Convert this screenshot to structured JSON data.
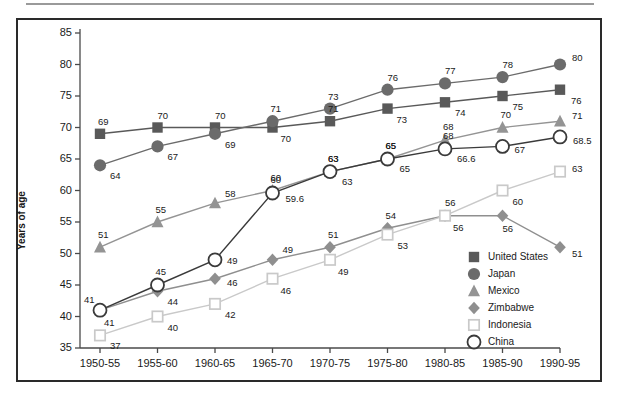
{
  "chart_data": {
    "type": "line",
    "title": "",
    "xlabel": "",
    "ylabel": "Years of age",
    "ylim": [
      35,
      85
    ],
    "yticks": [
      35,
      40,
      45,
      50,
      55,
      60,
      65,
      70,
      75,
      80,
      85
    ],
    "grid": false,
    "legend_position": "inside-lower-right",
    "categories": [
      "1950-55",
      "1955-60",
      "1960-65",
      "1965-70",
      "1970-75",
      "1975-80",
      "1980-85",
      "1985-90",
      "1990-95"
    ],
    "series": [
      {
        "name": "United States",
        "marker": "filled-square",
        "color": "#595959",
        "values": [
          69,
          70,
          70,
          70,
          71,
          73,
          74,
          75,
          76
        ],
        "labels": [
          "69",
          "70",
          "70",
          "70",
          "71",
          "73",
          "74",
          "75",
          "76"
        ]
      },
      {
        "name": "Japan",
        "marker": "filled-circle",
        "color": "#6b6b6b",
        "values": [
          64,
          67,
          69,
          71,
          73,
          76,
          77,
          78,
          80
        ],
        "labels": [
          "64",
          "67",
          "69",
          "71",
          "73",
          "76",
          "77",
          "78",
          "80"
        ]
      },
      {
        "name": "Mexico",
        "marker": "filled-triangle",
        "color": "#949494",
        "values": [
          51,
          55,
          58,
          60,
          63,
          65,
          68,
          70,
          71
        ],
        "labels": [
          "51",
          "55",
          "58",
          "60",
          "63",
          "65",
          "68",
          "70",
          "71"
        ]
      },
      {
        "name": "Zimbabwe",
        "marker": "filled-diamond",
        "color": "#8f8f8f",
        "values": [
          41,
          44,
          46,
          49,
          51,
          54,
          56,
          56,
          51
        ],
        "labels": [
          "41",
          "44",
          "46",
          "49",
          "51",
          "54",
          "56",
          "56",
          "51"
        ]
      },
      {
        "name": "Indonesia",
        "marker": "open-square",
        "color": "#c9c9c9",
        "values": [
          37,
          40,
          42,
          46,
          49,
          53,
          56,
          60,
          63
        ],
        "labels": [
          "37",
          "40",
          "42",
          "46",
          "49",
          "53",
          "56",
          "60",
          "63"
        ]
      },
      {
        "name": "China",
        "marker": "open-circle",
        "color": "#3a3a3a",
        "values": [
          41,
          45,
          49,
          59.6,
          63,
          65,
          66.6,
          67,
          68.5
        ],
        "labels": [
          "41",
          "45",
          "49",
          "60",
          "63",
          "65",
          "68",
          "67",
          "68.5"
        ],
        "value_labels": [
          "41",
          "45",
          "49",
          "59.6",
          "63",
          "65",
          "66.6",
          "67",
          "68.5"
        ]
      }
    ],
    "colors": {
      "axis": "#4a4a4a",
      "frame": "#2a2a2a",
      "text": "#1a1a1a",
      "background": "#ffffff"
    }
  },
  "legend": {
    "items": [
      {
        "label": "United States",
        "marker": "filled-square"
      },
      {
        "label": "Japan",
        "marker": "filled-circle"
      },
      {
        "label": "Mexico",
        "marker": "filled-triangle"
      },
      {
        "label": "Zimbabwe",
        "marker": "filled-diamond"
      },
      {
        "label": "Indonesia",
        "marker": "open-square"
      },
      {
        "label": "China",
        "marker": "open-circle"
      }
    ]
  }
}
